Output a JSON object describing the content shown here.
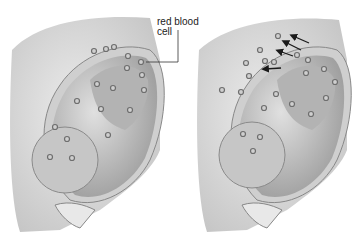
{
  "diagram": {
    "label": {
      "line1": "red blood",
      "line2": "cell"
    },
    "panels": [
      {
        "name": "left",
        "description": "Fetal red blood cells within fetal circulation"
      },
      {
        "name": "right",
        "description": "Fetal red blood cells crossing placenta into maternal circulation (arrows)"
      }
    ],
    "colors": {
      "tissue": "#d9d9d9",
      "fetus": "#bdbdbd",
      "shadow": "#8c8c8c",
      "cell": "#9a9a9a",
      "arrow": "#1a1a1a",
      "background": "#ffffff"
    },
    "arrow_count": 4
  }
}
